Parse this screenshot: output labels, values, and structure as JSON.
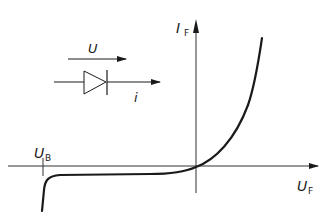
{
  "diagram": {
    "type": "diode I-V characteristic",
    "axes": {
      "y_label": "I",
      "y_label_subscript": "F",
      "x_label": "U",
      "x_label_subscript": "F"
    },
    "breakdown_label": "U",
    "breakdown_label_subscript": "B",
    "symbol": {
      "voltage_label": "U",
      "current_label": "i"
    },
    "colors": {
      "line": "#1a1a1a",
      "axis": "#333333",
      "background": "#ffffff"
    }
  }
}
